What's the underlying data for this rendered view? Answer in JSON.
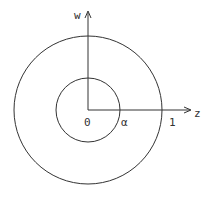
{
  "diagram": {
    "axes": {
      "horizontal_label": "z",
      "vertical_label": "w"
    },
    "points": {
      "origin_label": "0",
      "inner_radius_label": "α",
      "outer_radius_label": "1"
    },
    "circles": [
      {
        "name": "inner",
        "radius_label": "α"
      },
      {
        "name": "outer",
        "radius_label": "1"
      }
    ],
    "colors": {
      "stroke": "#333333",
      "background": "#ffffff"
    }
  }
}
